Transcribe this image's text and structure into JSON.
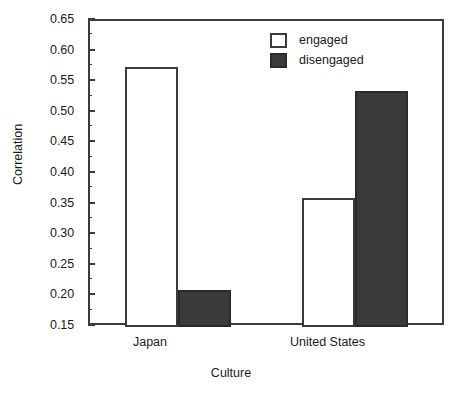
{
  "chart_data": {
    "type": "bar",
    "title": "",
    "xlabel": "Culture",
    "ylabel": "Correlation",
    "categories": [
      "Japan",
      "United States"
    ],
    "series": [
      {
        "name": "engaged",
        "values": [
          0.575,
          0.36
        ],
        "color": "#ffffff"
      },
      {
        "name": "disengaged",
        "values": [
          0.21,
          0.535
        ],
        "color": "#3a3a3a"
      }
    ],
    "ylim": [
      0.15,
      0.65
    ],
    "y_ticks": [
      "0.65",
      "0.60",
      "0.55",
      "0.50",
      "0.45",
      "0.40",
      "0.35",
      "0.30",
      "0.25",
      "0.20",
      "0.15"
    ],
    "y_tick_values": [
      0.65,
      0.6,
      0.55,
      0.5,
      0.45,
      0.4,
      0.35,
      0.3,
      0.25,
      0.2,
      0.15
    ],
    "y_minor_ticks": [
      0.625,
      0.575,
      0.525,
      0.475,
      0.425,
      0.375,
      0.325,
      0.275,
      0.225,
      0.175
    ],
    "grid": false,
    "legend_position": "top-right",
    "legend_entries": [
      "engaged",
      "disengaged"
    ],
    "axis_color": "#3b3b3b",
    "background": "#ffffff"
  },
  "axes": {
    "y_title": "Correlation",
    "x_title": "Culture",
    "y_tick_labels": [
      "0.65",
      "0.60",
      "0.55",
      "0.50",
      "0.45",
      "0.40",
      "0.35",
      "0.30",
      "0.25",
      "0.20",
      "0.15"
    ],
    "x_tick_labels": [
      "Japan",
      "United States"
    ]
  },
  "legend": {
    "items": [
      {
        "label": "engaged"
      },
      {
        "label": "disengaged"
      }
    ]
  }
}
